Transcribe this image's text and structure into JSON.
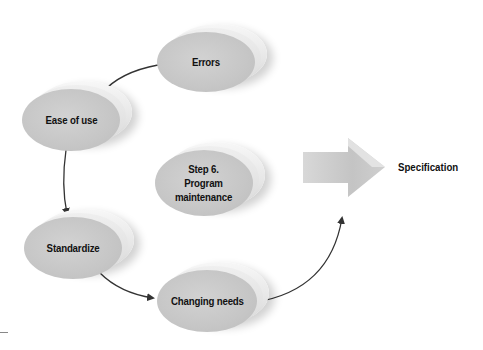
{
  "diagram": {
    "type": "cycle",
    "center": {
      "label_lines": [
        "Step 6.",
        "Program",
        "maintenance"
      ]
    },
    "nodes": [
      {
        "id": "errors",
        "label": "Errors"
      },
      {
        "id": "ease",
        "label": "Ease of use"
      },
      {
        "id": "standardize",
        "label": "Standardize"
      },
      {
        "id": "changing",
        "label": "Changing needs"
      }
    ],
    "output": {
      "label": "Specification"
    },
    "edges": [
      {
        "from": "Errors",
        "to": "Ease of use"
      },
      {
        "from": "Ease of use",
        "to": "Standardize"
      },
      {
        "from": "Standardize",
        "to": "Changing needs"
      },
      {
        "from": "Changing needs",
        "to": "Specification"
      }
    ],
    "colors": {
      "disc": "#c6c6c6",
      "arrow": "#333333",
      "text": "#111111"
    }
  }
}
